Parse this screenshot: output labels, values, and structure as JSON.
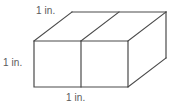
{
  "figure": {
    "name": "rectangular-prism-two-unit-cubes",
    "type": "geometric-diagram",
    "background_color": "#ffffff",
    "line_color": "#4a4a4a",
    "line_width": 1.2,
    "label_color": "#5a5a5a",
    "labels": {
      "top": "1 in.",
      "left": "1 in.",
      "bottom": "1 in."
    },
    "geometry": {
      "description": "Rectangular prism composed of two unit cubes side by side, drawn in oblique projection",
      "front_face": {
        "top_left": [
          34,
          41
        ],
        "top_right": [
          128,
          41
        ],
        "bottom_right": [
          128,
          87
        ],
        "bottom_left": [
          34,
          87
        ],
        "divider_x": 81
      },
      "depth_offset": [
        38,
        -29
      ],
      "back_top_left": [
        72,
        12
      ],
      "back_top_right": [
        166,
        12
      ],
      "back_bottom_right": [
        166,
        58
      ],
      "top_face_divider": {
        "from": [
          81,
          41
        ],
        "to": [
          119,
          12
        ]
      }
    }
  }
}
